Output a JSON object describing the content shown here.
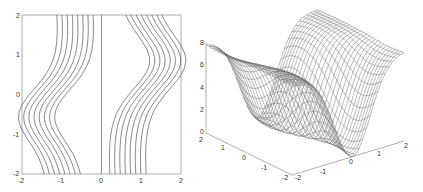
{
  "chart_data": [
    {
      "type": "contour",
      "title": "",
      "xlabel": "",
      "ylabel": "",
      "xlim": [
        -2,
        2
      ],
      "ylim": [
        -2,
        2
      ],
      "xticks": [
        "-2",
        "-1",
        "0",
        "1",
        "2"
      ],
      "yticks": [
        "2",
        "1",
        "0",
        "-1",
        "-2"
      ],
      "grid": false,
      "colors": {
        "line": "#555555",
        "axis": "#888888"
      },
      "notes": "Two families of ~8 nested S-shaped contour lines, left family bulging to x≈-1.7 near y≈-0.5, right family bulging to x≈1.7 near y≈0.8; a vertical line at x=0.",
      "contour_levels_count": 8
    },
    {
      "type": "surface",
      "title": "",
      "zlim": [
        0,
        8
      ],
      "zticks": [
        "8",
        "6",
        "4",
        "2",
        "0"
      ],
      "xticks_left_axis": [
        "2",
        "1",
        "0",
        "-1",
        "-2"
      ],
      "yticks_right_axis": [
        "-2",
        "-1",
        "0",
        "1",
        "2"
      ],
      "colors": {
        "mesh": "#666666",
        "axis": "#888888"
      },
      "notes": "3D wireframe mesh: flat plateaus at z≈8 at the back-right and left edges, a deep valley descending to z≈0 at the front corner."
    }
  ],
  "labels": {
    "left": {
      "x": [
        "-2",
        "-1",
        "0",
        "1",
        "2"
      ],
      "y": [
        "2",
        "1",
        "0",
        "-1",
        "-2"
      ]
    },
    "right": {
      "z": [
        "8",
        "6",
        "4",
        "2",
        "0"
      ],
      "a": [
        "2",
        "1",
        "0",
        "-1",
        "-2"
      ],
      "b": [
        "-2",
        "-1",
        "0",
        "1",
        "2"
      ]
    }
  }
}
